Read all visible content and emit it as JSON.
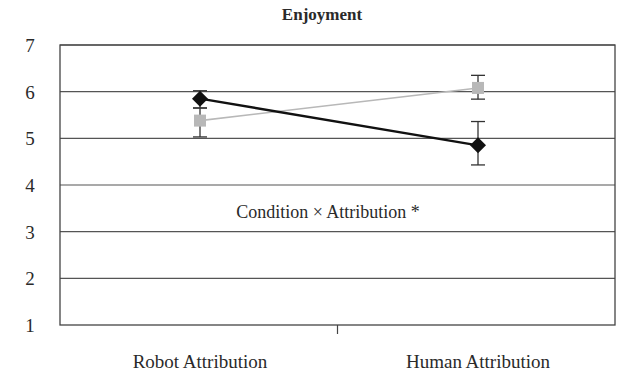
{
  "chart_data": {
    "type": "line",
    "title": "Enjoyment",
    "xlabel": "",
    "ylabel": "",
    "categories": [
      "Robot Attribution",
      "Human Attribution"
    ],
    "ylim": [
      1,
      7
    ],
    "yticks": [
      1,
      2,
      3,
      4,
      5,
      6,
      7
    ],
    "grid": true,
    "legend": null,
    "series": [
      {
        "name": "Series A (black diamond)",
        "marker": "diamond",
        "color": "#111111",
        "values": [
          5.85,
          4.85
        ],
        "error_low": [
          5.65,
          4.43
        ],
        "error_high": [
          6.02,
          5.36
        ]
      },
      {
        "name": "Series B (gray square)",
        "marker": "square",
        "color": "#b8b8b8",
        "values": [
          5.38,
          6.08
        ],
        "error_low": [
          5.03,
          5.84
        ],
        "error_high": [
          5.65,
          6.35
        ]
      }
    ],
    "annotations": [
      "Condition × Attribution *"
    ]
  },
  "labels": {
    "title": "Enjoyment",
    "annotation": "Condition × Attribution *",
    "y_ticks": [
      "7",
      "6",
      "5",
      "4",
      "3",
      "2",
      "1"
    ],
    "categories": [
      "Robot Attribution",
      "Human Attribution"
    ]
  }
}
